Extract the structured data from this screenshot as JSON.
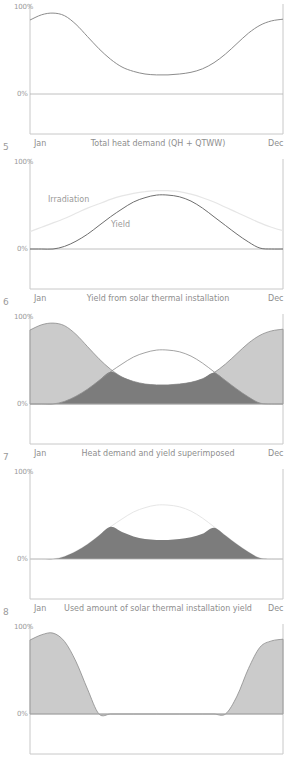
{
  "colors": {
    "axis": "#c8c8c8",
    "zero_line": "#b0b0b0",
    "demand_line": "#8c8c8c",
    "yield_line": "#6e6e6e",
    "irradiation_line": "#e6e6e6",
    "light_fill": "#cbcbcb",
    "dark_fill": "#7c7c7c"
  },
  "layout": {
    "panel_tops": [
      0,
      155,
      310,
      465,
      620
    ],
    "x_left": 30,
    "x_right": 283,
    "y_zero": 94,
    "y_bottom": 134,
    "y_top": 4,
    "px_per_pct": 0.87
  },
  "panels": [
    {
      "number": "",
      "y_max": "100%",
      "y_zero": "0%",
      "x_start": "Jan",
      "x_end": "Dec",
      "caption": "Total heat demand (QH + QTWW)"
    },
    {
      "number": "5",
      "y_max": "100%",
      "y_zero": "0%",
      "x_start": "Jan",
      "x_end": "Dec",
      "caption": "Yield from solar thermal installation",
      "labels": {
        "irradiation": "Irradiation",
        "yield": "Yield"
      }
    },
    {
      "number": "6",
      "y_max": "100%",
      "y_zero": "0%",
      "x_start": "Jan",
      "x_end": "Dec",
      "caption": "Heat demand and yield superimposed"
    },
    {
      "number": "7",
      "y_max": "100%",
      "y_zero": "0%",
      "x_start": "Jan",
      "x_end": "Dec",
      "caption": "Used amount of solar thermal installation yield"
    },
    {
      "number": "8",
      "y_max": "100%",
      "y_zero": "0%",
      "x_start": "",
      "x_end": "",
      "caption": ""
    }
  ],
  "chart_data": [
    {
      "type": "line",
      "title": "Total heat demand (QH + QTWW)",
      "xlabel": "",
      "ylabel": "",
      "x_ticks": [
        "Jan",
        "Dec"
      ],
      "y_ticks": [
        "0%",
        "100%"
      ],
      "ylim": [
        -46,
        100
      ],
      "x": [
        0,
        0.5,
        1,
        1.5,
        2,
        2.5,
        3,
        3.5,
        4,
        4.5,
        5,
        5.5,
        6,
        6.5,
        7,
        7.5,
        8,
        8.5,
        9,
        9.5,
        10,
        10.5,
        11
      ],
      "series": [
        {
          "name": "Heat demand",
          "values": [
            85,
            91,
            93,
            90,
            80,
            66,
            52,
            40,
            31,
            26,
            23,
            22,
            22,
            23,
            25,
            29,
            36,
            46,
            58,
            70,
            79,
            84,
            86
          ]
        }
      ]
    },
    {
      "type": "line",
      "title": "Yield from solar thermal installation",
      "x_ticks": [
        "Jan",
        "Dec"
      ],
      "y_ticks": [
        "0%",
        "100%"
      ],
      "ylim": [
        -46,
        100
      ],
      "x": [
        0,
        0.5,
        1,
        1.5,
        2,
        2.5,
        3,
        3.5,
        4,
        4.5,
        5,
        5.5,
        6,
        6.5,
        7,
        7.5,
        8,
        8.5,
        9,
        9.5,
        10,
        10.5,
        11
      ],
      "series": [
        {
          "name": "Irradiation",
          "values": [
            20,
            25,
            30,
            35,
            41,
            47,
            52,
            57,
            61,
            64,
            66,
            67,
            67,
            66,
            63,
            59,
            54,
            48,
            42,
            36,
            30,
            25,
            21
          ]
        },
        {
          "name": "Yield",
          "values": [
            0,
            0,
            0,
            3,
            9,
            17,
            27,
            37,
            46,
            54,
            59,
            62,
            62,
            60,
            55,
            47,
            37,
            27,
            17,
            8,
            1,
            0,
            0
          ]
        }
      ]
    },
    {
      "type": "area",
      "title": "Heat demand and yield superimposed",
      "x_ticks": [
        "Jan",
        "Dec"
      ],
      "y_ticks": [
        "0%",
        "100%"
      ],
      "ylim": [
        -46,
        100
      ],
      "series": [
        {
          "name": "Heat demand (uncovered)",
          "fill": "light"
        },
        {
          "name": "Yield used (overlap)",
          "fill": "dark"
        },
        {
          "name": "Yield (outline)",
          "fill": "none"
        }
      ]
    },
    {
      "type": "area",
      "title": "Used amount of solar thermal installation yield",
      "x_ticks": [
        "Jan",
        "Dec"
      ],
      "y_ticks": [
        "0%",
        "100%"
      ],
      "ylim": [
        -46,
        100
      ],
      "series": [
        {
          "name": "Used yield = min(heat demand, yield)",
          "fill": "dark"
        }
      ]
    },
    {
      "type": "area",
      "title": "",
      "x_ticks": [],
      "y_ticks": [
        "0%",
        "100%"
      ],
      "ylim": [
        -46,
        100
      ],
      "series": [
        {
          "name": "Remaining heat demand = max(demand - yield, 0) shown as demand where yield below",
          "fill": "light"
        }
      ]
    }
  ]
}
